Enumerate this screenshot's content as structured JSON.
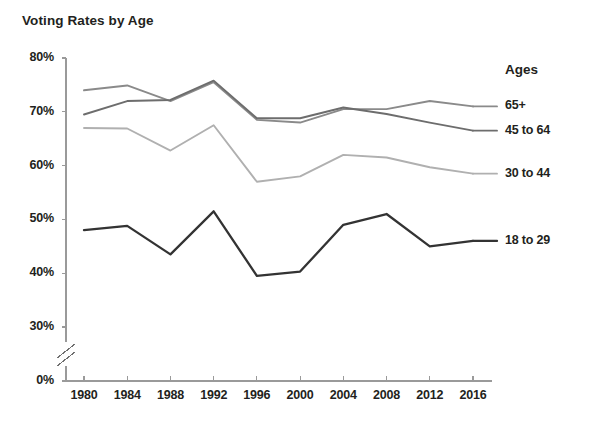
{
  "chart_data": {
    "type": "line",
    "title": "Voting Rates by Age",
    "xlabel": "",
    "ylabel": "",
    "x": [
      1980,
      1984,
      1988,
      1992,
      1996,
      2000,
      2004,
      2008,
      2012,
      2016
    ],
    "xtick_labels": [
      "1980",
      "1984",
      "1988",
      "1992",
      "1996",
      "2000",
      "2004",
      "2008",
      "2012",
      "2016"
    ],
    "ytick_labels": [
      "0%",
      "30%",
      "40%",
      "50%",
      "60%",
      "70%",
      "80%"
    ],
    "ytick_values": [
      0,
      30,
      40,
      50,
      60,
      70,
      80
    ],
    "ylim": [
      30,
      80
    ],
    "axis_break": true,
    "grid": false,
    "legend_position": "right",
    "legend_title": "Ages",
    "series": [
      {
        "name": "65+",
        "color": "#8a8a8a",
        "values": [
          74.0,
          74.9,
          72.0,
          75.5,
          68.5,
          68.0,
          70.5,
          70.5,
          72.0,
          71.0
        ]
      },
      {
        "name": "45 to 64",
        "color": "#6d6d6d",
        "values": [
          69.5,
          72.0,
          72.2,
          75.8,
          68.8,
          68.8,
          70.8,
          69.6,
          68.0,
          66.5
        ]
      },
      {
        "name": "30 to 44",
        "color": "#b0b0b0",
        "values": [
          67.0,
          66.9,
          62.8,
          67.5,
          57.0,
          58.0,
          62.0,
          61.5,
          59.7,
          58.5
        ]
      },
      {
        "name": "18 to 29",
        "color": "#333333",
        "values": [
          48.0,
          48.8,
          43.5,
          51.5,
          39.5,
          40.3,
          49.0,
          51.0,
          45.0,
          46.0
        ]
      }
    ]
  }
}
